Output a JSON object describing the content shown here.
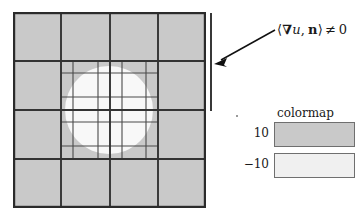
{
  "figure": {
    "name": "adaptive-mesh-level-set-figure",
    "domain_square": {
      "border_color": "#2b2b2b",
      "exterior_fill": "#c9c9c9",
      "interior_fill": "#f6f6f6"
    },
    "mesh": {
      "coarse_divisions": 4,
      "refined_divisions": 8,
      "line_color": "#3a3a3a",
      "coarse_x": [
        0,
        48,
        97,
        145,
        193
      ],
      "coarse_y": [
        0,
        49,
        98,
        147,
        196
      ],
      "refined_x": [
        60,
        85,
        109,
        133
      ],
      "refined_y": [
        61,
        85,
        110,
        134
      ],
      "refined_region": {
        "x0": 48,
        "y0": 49,
        "x1": 145,
        "y1": 147
      }
    },
    "level_set_circle": {
      "cx": 96,
      "cy": 98,
      "r": 44,
      "fill": "#f8f8f8"
    }
  },
  "boundary_annotation": {
    "marker_bar_label": "boundary-segment-marker",
    "arrow_label": "annotation-arrow",
    "formula": {
      "open_bracket": "⟨",
      "nabla": "∇",
      "field": "u",
      "comma": ",",
      "normal": "n",
      "close_bracket": "⟩",
      "relation": "≠",
      "value": "0",
      "full_text": "⟨∇u, n⟩ ≠ 0"
    }
  },
  "colormap_legend": {
    "title": "colormap",
    "entries": [
      {
        "label": "10",
        "swatch_color": "#c9c9c9"
      },
      {
        "label": "−10",
        "swatch_color": "#f0f0f0"
      }
    ]
  },
  "chart_data": {
    "type": "heatmap",
    "title": "colormap",
    "xlabel": "",
    "ylabel": "",
    "legend_position": "right",
    "grid": true,
    "colorbar": {
      "ticks": [
        10,
        -10
      ],
      "tick_labels": [
        "10",
        "−10"
      ],
      "colors": [
        "#c9c9c9",
        "#f0f0f0"
      ]
    },
    "annotations": [
      {
        "text": "⟨∇u, n⟩ ≠ 0",
        "target": "right-boundary-segment",
        "type": "arrow"
      }
    ]
  }
}
